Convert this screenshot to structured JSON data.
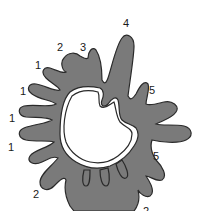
{
  "figure": {
    "fill_color": "#7a7a7a",
    "stroke_color": "#2a2a2a",
    "background_color": "#ffffff",
    "labels": [
      {
        "id": "label-1a",
        "text": "1",
        "x": 35,
        "y": 69
      },
      {
        "id": "label-1b",
        "text": "1",
        "x": 20,
        "y": 95
      },
      {
        "id": "label-1c",
        "text": "1",
        "x": 9,
        "y": 122
      },
      {
        "id": "label-1d",
        "text": "1",
        "x": 8,
        "y": 151
      },
      {
        "id": "label-2a",
        "text": "2",
        "x": 57,
        "y": 51
      },
      {
        "id": "label-3",
        "text": "3",
        "x": 80,
        "y": 51
      },
      {
        "id": "label-4",
        "text": "4",
        "x": 123,
        "y": 27
      },
      {
        "id": "label-5a",
        "text": "5",
        "x": 149,
        "y": 94
      },
      {
        "id": "label-5b",
        "text": "5",
        "x": 153,
        "y": 160
      },
      {
        "id": "label-2b",
        "text": "2",
        "x": 33,
        "y": 198
      },
      {
        "id": "label-2c",
        "text": "2",
        "x": 143,
        "y": 215
      }
    ]
  }
}
